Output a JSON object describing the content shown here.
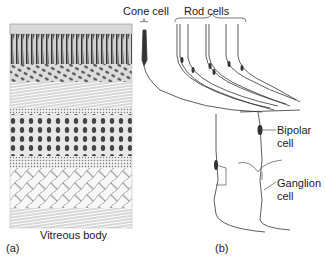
{
  "figure": {
    "panel_a": {
      "label": "(a)",
      "caption": "Vitreous body"
    },
    "panel_b": {
      "label": "(b)",
      "callouts": {
        "cone": "Cone cell",
        "rods": "Rod cells",
        "bipolar_line1": "Bipolar",
        "bipolar_line2": "cell",
        "ganglion_line1": "Ganglion",
        "ganglion_line2": "cell"
      }
    }
  }
}
